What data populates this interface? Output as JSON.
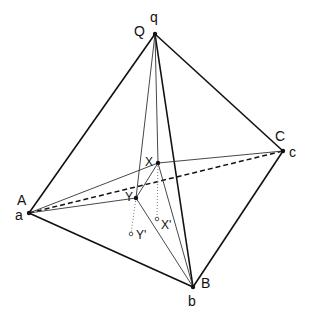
{
  "diagram": {
    "type": "tetrahedron-with-interior-points",
    "colors": {
      "stroke": "#111111",
      "thin": "#333333",
      "dotted": "#777777",
      "background": "#ffffff"
    },
    "vertices": {
      "q": {
        "x": 155,
        "y": 34
      },
      "a": {
        "x": 29,
        "y": 213
      },
      "b": {
        "x": 193,
        "y": 287
      },
      "c": {
        "x": 283,
        "y": 151
      },
      "X": {
        "x": 158,
        "y": 163
      },
      "Y": {
        "x": 136,
        "y": 198
      },
      "Xp": {
        "x": 157,
        "y": 219
      },
      "Yp": {
        "x": 131,
        "y": 234
      }
    },
    "labels": {
      "Q": "Q",
      "q": "q",
      "A": "A",
      "a": "a",
      "B": "B",
      "b": "b",
      "C": "C",
      "c": "c",
      "X": "X",
      "Y": "Y",
      "Xp": "X'",
      "Yp": "Y'"
    },
    "edges": {
      "thick": [
        [
          "q",
          "a"
        ],
        [
          "q",
          "c"
        ],
        [
          "q",
          "b"
        ],
        [
          "a",
          "b"
        ],
        [
          "b",
          "c"
        ]
      ],
      "dashed": [
        [
          "a",
          "c"
        ]
      ],
      "thin": [
        [
          "q",
          "X"
        ],
        [
          "q",
          "Y"
        ],
        [
          "a",
          "X"
        ],
        [
          "a",
          "Y"
        ],
        [
          "X",
          "c"
        ],
        [
          "X",
          "Y"
        ],
        [
          "X",
          "b"
        ],
        [
          "Y",
          "b"
        ]
      ],
      "dotted": [
        [
          "X",
          "Xp"
        ],
        [
          "Y",
          "Yp"
        ]
      ]
    }
  }
}
